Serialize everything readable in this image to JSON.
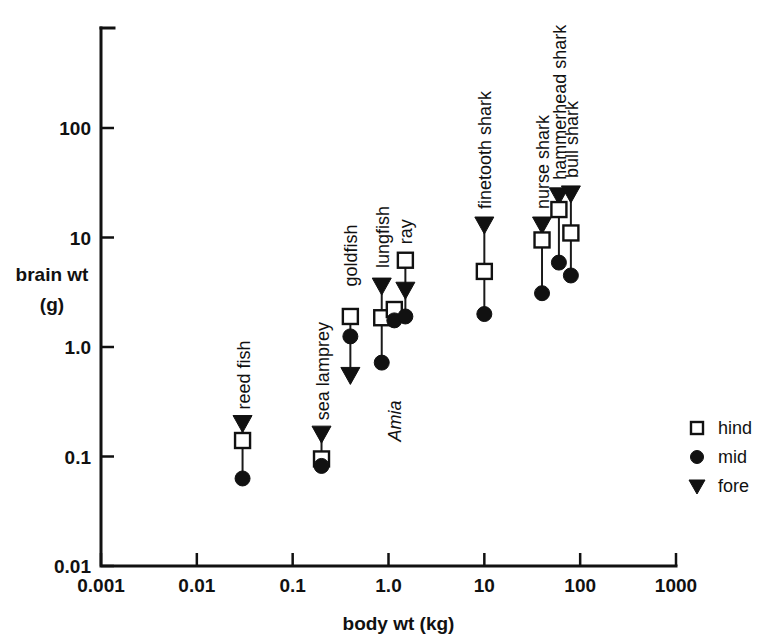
{
  "chart_data": {
    "type": "scatter",
    "title": "",
    "xlabel": "body wt (kg)",
    "ylabel_line1": "brain wt",
    "ylabel_line2": "(g)",
    "xscale": "log",
    "yscale": "log",
    "xlim": [
      0.001,
      1000
    ],
    "ylim": [
      0.001,
      1000
    ],
    "grid": false,
    "xticks": [
      "0.001",
      "0.01",
      "0.1",
      "1.0",
      "10",
      "100",
      "1000"
    ],
    "xtick_values": [
      0.001,
      0.01,
      0.1,
      1.0,
      10,
      100,
      1000
    ],
    "yticks": [
      "100",
      "10",
      "1.0",
      "0.1",
      "0.01"
    ],
    "ytick_values": [
      100,
      10,
      1.0,
      0.1,
      0.01
    ],
    "legend": {
      "position": "right-middle",
      "entries": [
        {
          "marker": "open-square",
          "label": "hind"
        },
        {
          "marker": "filled-circle",
          "label": "mid"
        },
        {
          "marker": "filled-triangle-down",
          "label": "fore"
        }
      ]
    },
    "series": [
      {
        "name": "hind",
        "marker": "open-square"
      },
      {
        "name": "mid",
        "marker": "filled-circle"
      },
      {
        "name": "fore",
        "marker": "filled-triangle-down"
      }
    ],
    "groups": [
      {
        "name": "reed fish",
        "label": "reed fish",
        "italic": false,
        "body_wt_kg": 0.03,
        "points": [
          {
            "series": "fore",
            "brain_wt_g": 0.2
          },
          {
            "series": "hind",
            "brain_wt_g": 0.14
          },
          {
            "series": "mid",
            "brain_wt_g": 0.063
          }
        ]
      },
      {
        "name": "sea lamprey",
        "label": "sea lamprey",
        "italic": false,
        "body_wt_kg": 0.2,
        "points": [
          {
            "series": "fore",
            "brain_wt_g": 0.16
          },
          {
            "series": "hind",
            "brain_wt_g": 0.095
          },
          {
            "series": "mid",
            "brain_wt_g": 0.082
          }
        ]
      },
      {
        "name": "goldfish",
        "label": "goldfish",
        "italic": false,
        "body_wt_kg": 0.4,
        "points": [
          {
            "series": "hind",
            "brain_wt_g": 1.9
          },
          {
            "series": "mid",
            "brain_wt_g": 1.25
          },
          {
            "series": "fore",
            "brain_wt_g": 0.55
          }
        ]
      },
      {
        "name": "lungfish",
        "label": "lungfish",
        "italic": false,
        "body_wt_kg": 0.85,
        "points": [
          {
            "series": "fore",
            "brain_wt_g": 3.6
          },
          {
            "series": "hind",
            "brain_wt_g": 1.85
          },
          {
            "series": "mid",
            "brain_wt_g": 0.72
          }
        ]
      },
      {
        "name": "Amia",
        "label": "Amia",
        "italic": true,
        "body_wt_kg": 1.15,
        "points": [
          {
            "series": "hind",
            "brain_wt_g": 2.2
          },
          {
            "series": "mid",
            "brain_wt_g": 1.75
          }
        ]
      },
      {
        "name": "ray",
        "label": "ray",
        "italic": false,
        "body_wt_kg": 1.5,
        "points": [
          {
            "series": "hind",
            "brain_wt_g": 6.2
          },
          {
            "series": "fore",
            "brain_wt_g": 3.3
          },
          {
            "series": "mid",
            "brain_wt_g": 1.9
          }
        ]
      },
      {
        "name": "finetooth shark",
        "label": "finetooth shark",
        "italic": false,
        "body_wt_kg": 10,
        "points": [
          {
            "series": "fore",
            "brain_wt_g": 13
          },
          {
            "series": "hind",
            "brain_wt_g": 4.9
          },
          {
            "series": "mid",
            "brain_wt_g": 2.0
          }
        ]
      },
      {
        "name": "nurse shark",
        "label": "nurse shark",
        "italic": false,
        "body_wt_kg": 40,
        "points": [
          {
            "series": "fore",
            "brain_wt_g": 13
          },
          {
            "series": "hind",
            "brain_wt_g": 9.5
          },
          {
            "series": "mid",
            "brain_wt_g": 3.1
          }
        ]
      },
      {
        "name": "hammerhead shark",
        "label": "hammerhead shark",
        "italic": false,
        "body_wt_kg": 60,
        "points": [
          {
            "series": "fore",
            "brain_wt_g": 24
          },
          {
            "series": "hind",
            "brain_wt_g": 18
          },
          {
            "series": "mid",
            "brain_wt_g": 5.9
          }
        ]
      },
      {
        "name": "bull shark",
        "label": "bull shark",
        "italic": false,
        "body_wt_kg": 80,
        "points": [
          {
            "series": "fore",
            "brain_wt_g": 25
          },
          {
            "series": "hind",
            "brain_wt_g": 11
          },
          {
            "series": "mid",
            "brain_wt_g": 4.5
          }
        ]
      }
    ]
  },
  "colors": {
    "ink": "#111111",
    "background": "#ffffff"
  }
}
